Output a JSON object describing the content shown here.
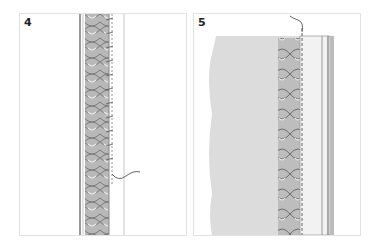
{
  "panels": [
    {
      "label": "4",
      "description": "Braided trim stitched along a vertical seam with whip stitches; thread tail exiting on right"
    },
    {
      "label": "5",
      "description": "Braided trim laid on fabric edge with a dashed stitch line along folded hem; thread exiting at top"
    }
  ],
  "colors": {
    "border": "#e2e2e2",
    "ink": "#555555",
    "fabric": "#d9d9d9",
    "braid": "#9a9a9a"
  }
}
